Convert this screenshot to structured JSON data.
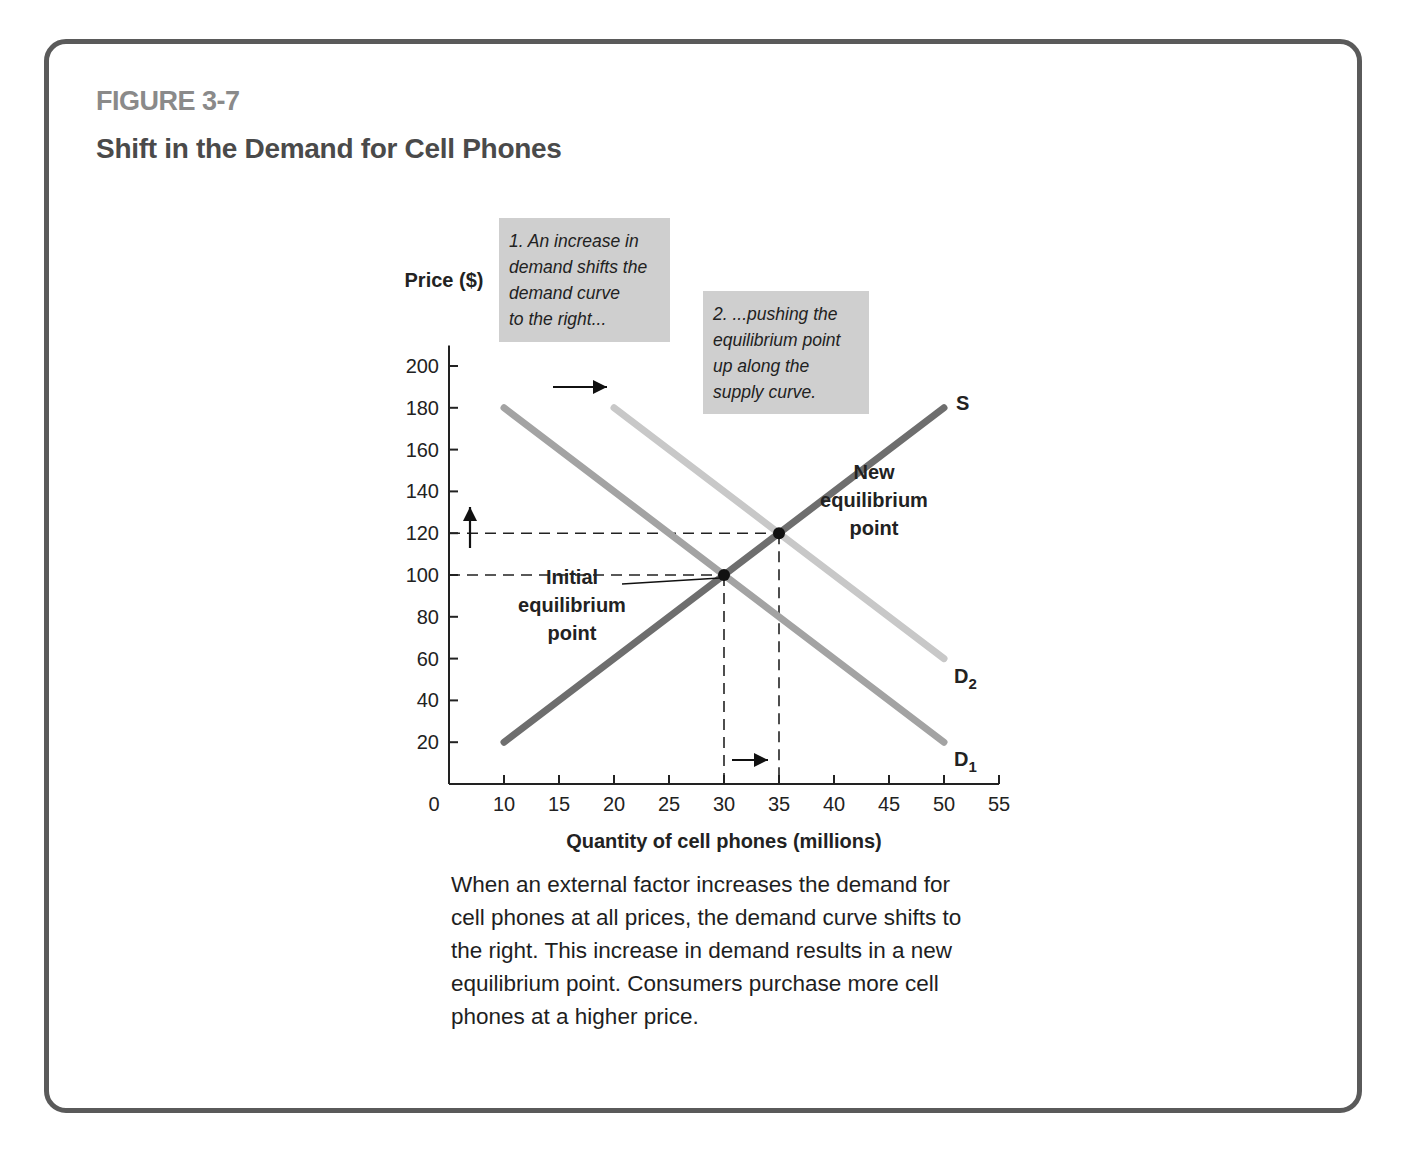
{
  "figure": {
    "number": "FIGURE 3-7",
    "title": "Shift in the Demand for Cell Phones"
  },
  "annotations": {
    "note1_lines": [
      "1. An increase in",
      "demand shifts the",
      "demand curve",
      "to the right..."
    ],
    "note2_lines": [
      "2. ...pushing the",
      "equilibrium point",
      "up along the",
      "supply curve."
    ],
    "initial_eq_lines": [
      "Initial",
      "equilibrium",
      "point"
    ],
    "new_eq_lines": [
      "New",
      "equilibrium",
      "point"
    ]
  },
  "caption_text": "When an external factor increases the demand for cell phones at all prices, the demand curve shifts to the right. This increase in demand results in a new equilibrium point. Consumers purchase more cell phones at a higher price.",
  "colors": {
    "supply": "#6e6e6e",
    "demand1": "#a3a3a3",
    "demand2": "#c8c8c8",
    "frame": "#5a5a5a",
    "note_bg": "#cfcfcf"
  },
  "chart_data": {
    "type": "line",
    "title": "Shift in the Demand for Cell Phones",
    "xlabel": "Quantity of cell phones (millions)",
    "ylabel": "Price ($)",
    "xlim": [
      5,
      55
    ],
    "ylim": [
      0,
      205
    ],
    "x_ticks": [
      10,
      15,
      20,
      25,
      30,
      35,
      40,
      45,
      50,
      55
    ],
    "x_origin_label": "0",
    "y_ticks": [
      20,
      40,
      60,
      80,
      100,
      120,
      140,
      160,
      180,
      200
    ],
    "grid": false,
    "series": [
      {
        "name": "S",
        "label": "S",
        "points": [
          [
            10,
            20
          ],
          [
            50,
            180
          ]
        ]
      },
      {
        "name": "D1",
        "label": "D",
        "sub": "1",
        "points": [
          [
            10,
            180
          ],
          [
            50,
            20
          ]
        ]
      },
      {
        "name": "D2",
        "label": "D",
        "sub": "2",
        "points": [
          [
            20,
            180
          ],
          [
            50,
            60
          ]
        ]
      }
    ],
    "equilibria": [
      {
        "name": "initial",
        "x": 30,
        "y": 100
      },
      {
        "name": "new",
        "x": 35,
        "y": 120
      }
    ]
  }
}
